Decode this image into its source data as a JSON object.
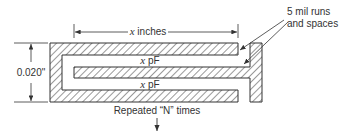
{
  "diagram": {
    "dimension_top": {
      "var": "x",
      "text": " inches"
    },
    "dimension_left": "0.020\"",
    "capacitance_labels": [
      {
        "var": "x",
        "text": " pF"
      },
      {
        "var": "x",
        "text": " pF"
      }
    ],
    "callout": [
      "5 mil runs",
      "and spaces"
    ],
    "footer": "Repeated “N” times",
    "colors": {
      "stroke": "#333333",
      "hatch": "#444444",
      "background": "#ffffff"
    }
  }
}
